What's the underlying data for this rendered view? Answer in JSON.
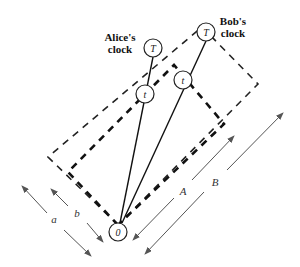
{
  "diagram": {
    "labels": {
      "alice_line1": "Alice's",
      "alice_line2": "clock",
      "bob_line1": "Bob's",
      "bob_line2": "clock"
    },
    "nodes": {
      "origin": "0",
      "alice_t": "t",
      "alice_T": "T",
      "bob_t": "t",
      "bob_T": "T"
    },
    "dimensions": {
      "a": "a",
      "b": "b",
      "A": "A",
      "B": "B"
    },
    "colors": {
      "line": "#111111",
      "arrow": "#555555"
    }
  }
}
